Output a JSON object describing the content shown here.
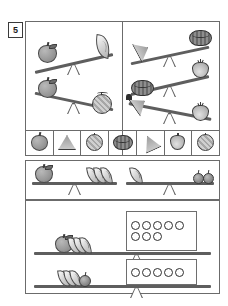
{
  "worksheet": {
    "exercise_number": "5",
    "ink_color": "#5e5e5e",
    "border_color": "#6b6b6b"
  },
  "panels": {
    "top_left": {
      "name": "fruit-comparison-panel",
      "scales": [
        {
          "id": "scale-apple-banana",
          "left_items": [
            {
              "icon": "apple-icon",
              "count": 1
            }
          ],
          "right_items": [
            {
              "icon": "banana-icon",
              "count": 1
            }
          ],
          "tilt": "left-down",
          "heavier": "left"
        },
        {
          "id": "scale-apple-melon",
          "left_items": [
            {
              "icon": "apple-icon",
              "count": 1
            }
          ],
          "right_items": [
            {
              "icon": "melon-icon",
              "count": 1
            }
          ],
          "tilt": "right-down",
          "heavier": "right"
        }
      ],
      "legend": [
        {
          "icon": "apple-icon",
          "label": "apple"
        },
        {
          "icon": "banana-icon",
          "label": "banana"
        },
        {
          "icon": "melon-icon",
          "label": "melon"
        }
      ]
    },
    "top_right": {
      "name": "vegetable-comparison-panel",
      "scales": [
        {
          "id": "scale-carrot-cabbage",
          "left_items": [
            {
              "icon": "carrot-icon",
              "count": 1
            }
          ],
          "right_items": [
            {
              "icon": "cabbage-icon",
              "count": 1
            }
          ],
          "tilt": "right-down",
          "heavier": "right"
        },
        {
          "id": "scale-cabbage-onion",
          "left_items": [
            {
              "icon": "cabbage-icon",
              "count": 1
            }
          ],
          "right_items": [
            {
              "icon": "onion-icon",
              "count": 1
            }
          ],
          "tilt": "left-down",
          "heavier": "left"
        },
        {
          "id": "scale-carrot-onion",
          "left_items": [
            {
              "icon": "carrot-icon",
              "count": 1
            }
          ],
          "right_items": [
            {
              "icon": "onion-icon",
              "count": 1
            }
          ],
          "tilt": "right-down",
          "heavier": "right"
        }
      ],
      "legend": [
        {
          "icon": "cabbage-icon",
          "label": "cabbage"
        },
        {
          "icon": "carrot-icon",
          "label": "carrot"
        },
        {
          "icon": "onion-icon",
          "label": "onion"
        },
        {
          "icon": "squash-icon",
          "label": "squash"
        }
      ]
    },
    "middle": {
      "name": "equivalence-panel",
      "scales": [
        {
          "id": "scale-apple-three-bananas",
          "left_items": [
            {
              "icon": "apple-icon",
              "count": 1
            }
          ],
          "right_items": [
            {
              "icon": "banana-icon",
              "count": 3
            }
          ],
          "tilt": "balanced",
          "heavier": "none"
        },
        {
          "id": "scale-banana-two-cherries",
          "left_items": [
            {
              "icon": "banana-icon",
              "count": 1
            }
          ],
          "right_items": [
            {
              "icon": "cherry-icon",
              "count": 2
            }
          ],
          "tilt": "balanced",
          "heavier": "none"
        }
      ]
    },
    "bottom": {
      "name": "weight-counting-panel",
      "scales": [
        {
          "id": "scale-apple-bananas-vs-eight-tokens",
          "left_items": [
            {
              "icon": "apple-icon",
              "count": 1
            },
            {
              "icon": "banana-icon",
              "count": 3
            }
          ],
          "right_tokens": 8,
          "token_rows": [
            5,
            3
          ],
          "tilt": "balanced"
        },
        {
          "id": "scale-bananas-cherry-vs-five-tokens",
          "left_items": [
            {
              "icon": "banana-icon",
              "count": 3
            },
            {
              "icon": "cherry-icon",
              "count": 1
            }
          ],
          "right_tokens": 5,
          "token_rows": [
            5
          ],
          "tilt": "balanced"
        }
      ]
    }
  }
}
